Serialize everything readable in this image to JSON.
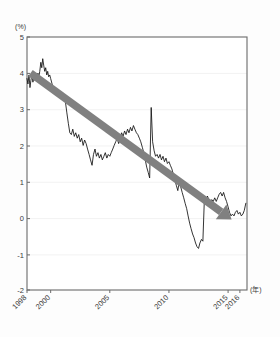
{
  "chart_data": {
    "type": "line",
    "title": "",
    "subtitle": "",
    "xlabel": "(年)",
    "ylabel": "(%)",
    "grid": true,
    "legend": "none",
    "xlim": [
      1998,
      2016.6
    ],
    "ylim": [
      -2,
      5
    ],
    "yticks": [
      5,
      4,
      3,
      2,
      1,
      0,
      -1,
      -2
    ],
    "ytick_labels": [
      "5",
      "4",
      "3",
      "2",
      "1",
      "0",
      "-1",
      "-2"
    ],
    "xticks": [
      1998,
      2000,
      2005,
      2010,
      2015,
      2016
    ],
    "xtick_labels": [
      "1998",
      "2000",
      "2005",
      "2010",
      "2015",
      "2016"
    ],
    "series": [
      {
        "name": "yield",
        "color": "#111111",
        "x": [
          1998.0,
          1998.08,
          1998.17,
          1998.25,
          1998.33,
          1998.42,
          1998.5,
          1998.58,
          1998.67,
          1998.75,
          1998.83,
          1998.92,
          1999.0,
          1999.08,
          1999.17,
          1999.25,
          1999.33,
          1999.42,
          1999.5,
          1999.58,
          1999.67,
          1999.75,
          1999.83,
          1999.92,
          2000.0,
          2000.12,
          2000.25,
          2000.37,
          2000.5,
          2000.62,
          2000.75,
          2000.87,
          2001.0,
          2001.12,
          2001.25,
          2001.37,
          2001.5,
          2001.62,
          2001.75,
          2001.87,
          2002.0,
          2002.12,
          2002.25,
          2002.37,
          2002.5,
          2002.62,
          2002.75,
          2002.87,
          2003.0,
          2003.12,
          2003.25,
          2003.37,
          2003.5,
          2003.62,
          2003.75,
          2003.87,
          2004.0,
          2004.12,
          2004.25,
          2004.37,
          2004.5,
          2004.62,
          2004.75,
          2004.87,
          2005.0,
          2005.12,
          2005.25,
          2005.37,
          2005.5,
          2005.62,
          2005.75,
          2005.87,
          2006.0,
          2006.12,
          2006.25,
          2006.37,
          2006.5,
          2006.62,
          2006.75,
          2006.87,
          2007.0,
          2007.12,
          2007.25,
          2007.37,
          2007.5,
          2007.62,
          2007.75,
          2007.87,
          2008.0,
          2008.12,
          2008.25,
          2008.37,
          2008.5,
          2008.62,
          2008.75,
          2008.87,
          2009.0,
          2009.12,
          2009.25,
          2009.37,
          2009.5,
          2009.62,
          2009.75,
          2009.87,
          2010.0,
          2010.12,
          2010.25,
          2010.37,
          2010.5,
          2010.62,
          2010.75,
          2010.87,
          2011.0,
          2011.12,
          2011.25,
          2011.37,
          2011.5,
          2011.62,
          2011.75,
          2011.87,
          2012.0,
          2012.12,
          2012.25,
          2012.37,
          2012.5,
          2012.62,
          2012.75,
          2012.87,
          2013.0,
          2013.12,
          2013.25,
          2013.37,
          2013.5,
          2013.62,
          2013.75,
          2013.87,
          2014.0,
          2014.12,
          2014.25,
          2014.37,
          2014.5,
          2014.62,
          2014.75,
          2014.87,
          2015.0,
          2015.12,
          2015.25,
          2015.37,
          2015.5,
          2015.62,
          2015.75,
          2015.87,
          2016.0,
          2016.12,
          2016.25,
          2016.37,
          2016.5
        ],
        "y": [
          3.85,
          3.7,
          3.95,
          3.6,
          3.8,
          3.95,
          3.75,
          3.9,
          3.8,
          3.95,
          3.85,
          4.0,
          3.9,
          4.05,
          4.3,
          4.15,
          4.4,
          4.2,
          4.05,
          4.15,
          3.95,
          4.05,
          3.9,
          3.95,
          3.85,
          3.7,
          3.55,
          3.45,
          3.5,
          3.35,
          3.45,
          3.3,
          3.45,
          3.3,
          3.2,
          2.9,
          2.6,
          2.35,
          2.3,
          2.45,
          2.25,
          2.35,
          2.2,
          2.3,
          2.1,
          2.2,
          2.0,
          2.15,
          2.05,
          1.9,
          1.75,
          1.6,
          1.45,
          1.75,
          1.9,
          1.7,
          1.8,
          1.65,
          1.75,
          1.6,
          1.7,
          1.8,
          1.65,
          1.75,
          1.7,
          1.8,
          1.9,
          2.0,
          2.1,
          2.2,
          2.05,
          2.2,
          2.35,
          2.25,
          2.4,
          2.3,
          2.45,
          2.35,
          2.5,
          2.4,
          2.55,
          2.45,
          2.35,
          2.3,
          2.2,
          2.1,
          1.95,
          1.8,
          1.6,
          1.4,
          1.25,
          1.1,
          3.05,
          2.1,
          1.85,
          1.7,
          1.75,
          1.65,
          1.75,
          1.6,
          1.7,
          1.55,
          1.65,
          1.5,
          1.55,
          1.45,
          1.35,
          1.2,
          1.05,
          0.9,
          0.75,
          1.0,
          0.85,
          0.7,
          0.55,
          0.4,
          0.25,
          0.05,
          -0.15,
          -0.3,
          -0.45,
          -0.55,
          -0.7,
          -0.8,
          -0.85,
          -0.7,
          -0.6,
          -0.65,
          0.55,
          0.45,
          0.6,
          0.5,
          0.4,
          0.5,
          0.45,
          0.55,
          0.45,
          0.55,
          0.65,
          0.7,
          0.6,
          0.7,
          0.55,
          0.45,
          0.3,
          0.15,
          0.05,
          0.1,
          0.05,
          0.15,
          0.2,
          0.1,
          0.15,
          0.05,
          0.1,
          0.2,
          0.4
        ]
      }
    ],
    "annotations": [
      {
        "type": "trend-arrow",
        "label": "downward trend arrow",
        "color": "#808080",
        "x_start": 1998.3,
        "y_start": 4.0,
        "x_end": 2015.3,
        "y_end": -0.05
      }
    ]
  },
  "axes": {
    "y_unit_label": "(%)",
    "x_unit_label": "(年)"
  }
}
